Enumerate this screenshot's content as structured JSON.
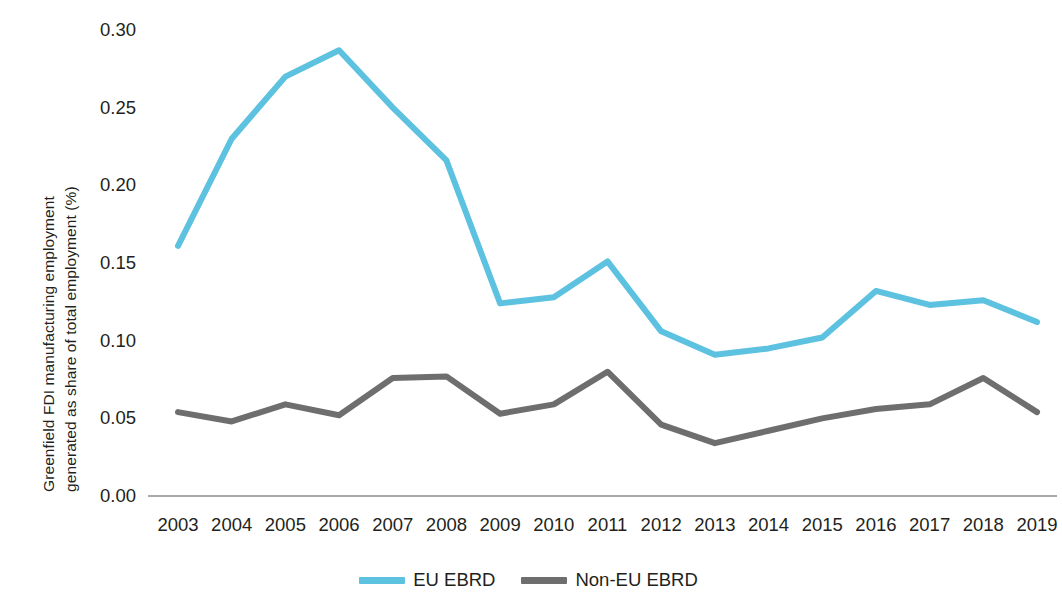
{
  "chart_data": {
    "type": "line",
    "title": "",
    "subtitle": "",
    "xlabel": "",
    "ylabel": "Greenfield FDI manufacturing employment generated as share of total employment (%)",
    "ylabel_line1": "Greenfield FDI manufacturing employment",
    "ylabel_line2": "generated as share of total employment (%)",
    "categories": [
      "2003",
      "2004",
      "2005",
      "2006",
      "2007",
      "2008",
      "2009",
      "2010",
      "2011",
      "2012",
      "2013",
      "2014",
      "2015",
      "2016",
      "2017",
      "2018",
      "2019"
    ],
    "x": [
      2003,
      2004,
      2005,
      2006,
      2007,
      2008,
      2009,
      2010,
      2011,
      2012,
      2013,
      2014,
      2015,
      2016,
      2017,
      2018,
      2019
    ],
    "series": [
      {
        "name": "EU EBRD",
        "color": "#5dc1e0",
        "values": [
          0.161,
          0.23,
          0.27,
          0.287,
          0.25,
          0.216,
          0.124,
          0.128,
          0.151,
          0.106,
          0.091,
          0.095,
          0.102,
          0.132,
          0.123,
          0.126,
          0.112
        ]
      },
      {
        "name": "Non-EU EBRD",
        "color": "#6e6e6e",
        "values": [
          0.054,
          0.048,
          0.059,
          0.052,
          0.076,
          0.077,
          0.053,
          0.059,
          0.08,
          0.046,
          0.034,
          0.042,
          0.05,
          0.056,
          0.059,
          0.076,
          0.054
        ]
      }
    ],
    "ylim": [
      0,
      0.3
    ],
    "yticks": [
      0.0,
      0.05,
      0.1,
      0.15,
      0.2,
      0.25,
      0.3
    ],
    "ytick_labels": [
      "0.00",
      "0.05",
      "0.10",
      "0.15",
      "0.20",
      "0.25",
      "0.30"
    ],
    "grid": false,
    "baseline_color": "#8c8c8c",
    "legend_position": "bottom-center"
  },
  "legend": {
    "items": [
      {
        "label": "EU EBRD",
        "color": "#5dc1e0"
      },
      {
        "label": "Non-EU EBRD",
        "color": "#6e6e6e"
      }
    ]
  }
}
